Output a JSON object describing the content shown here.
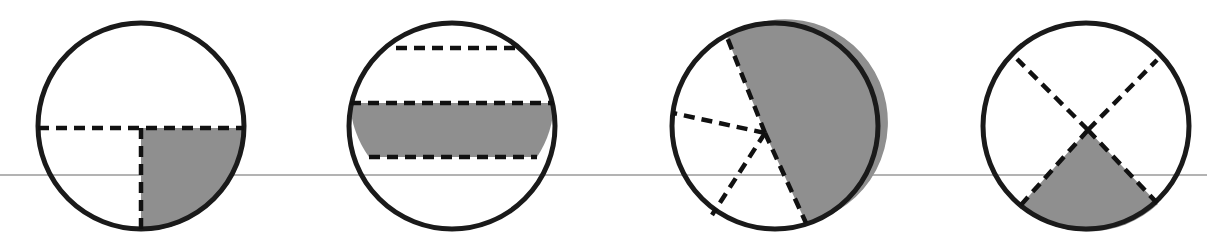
{
  "figure": {
    "width": 1207,
    "height": 251,
    "background_color": "#ffffff",
    "outline_color": "#1a1a1a",
    "outline_width": 5,
    "dash_color": "#111111",
    "dash_width": 4.5,
    "dash_pattern": "11 7",
    "shade_color": "#8f8f8f",
    "baseline_color": "#9a9a9a",
    "baseline_width": 1.6,
    "baseline_y": 175,
    "baseline_x_start": 0,
    "baseline_x_end": 1207
  },
  "circles": [
    {
      "name": "circle-quarter-sector",
      "label": "Circle 1 — quadrant shaded",
      "cx": 141,
      "cy": 126,
      "r": 103,
      "shaded_fraction": 0.25,
      "partition_type": "radius-cross",
      "lines": [
        {
          "name": "horizontal-dashed-chord",
          "x1": 38,
          "y1": 128,
          "x2": 244,
          "y2": 128
        },
        {
          "name": "vertical-dashed-radius",
          "x1": 141,
          "y1": 128,
          "x2": 141,
          "y2": 231
        }
      ],
      "shaded_path": "M 141 128 L 244 128 A 103 103 0 0 1 141 231 Z"
    },
    {
      "name": "circle-horizontal-bands",
      "label": "Circle 2 — horizontal band shaded",
      "cx": 452,
      "cy": 126,
      "r": 103,
      "shaded_fraction": 0.32,
      "partition_type": "parallel-chords",
      "lines": [
        {
          "name": "chord-upper-dashed",
          "x1": 396,
          "y1": 48,
          "x2": 522,
          "y2": 48
        },
        {
          "name": "chord-middle-dashed",
          "x1": 350,
          "y1": 103,
          "x2": 554,
          "y2": 103
        },
        {
          "name": "chord-lower-dashed",
          "x1": 369,
          "y1": 157,
          "x2": 537,
          "y2": 157
        }
      ],
      "shaded_path": "M 350 103 A 103 103 0 0 0 369 157 L 537 157 A 103 103 0 0 0 554 103 Z"
    },
    {
      "name": "circle-off-center-sectors",
      "label": "Circle 3 — large sector shaded",
      "cx": 775,
      "cy": 126,
      "r": 103,
      "shaded_fraction": 0.42,
      "partition_type": "rays-from-interior-point",
      "hub_x": 765,
      "hub_y": 133,
      "lines": [
        {
          "name": "ray-upper-left-dashed",
          "x1": 765,
          "y1": 133,
          "x2": 727,
          "y2": 37
        },
        {
          "name": "ray-left-dashed",
          "x1": 765,
          "y1": 133,
          "x2": 673,
          "y2": 113
        },
        {
          "name": "ray-lower-left-dashed",
          "x1": 765,
          "y1": 133,
          "x2": 712,
          "y2": 215
        },
        {
          "name": "ray-lower-right-dashed",
          "x1": 765,
          "y1": 133,
          "x2": 806,
          "y2": 223
        }
      ],
      "shaded_path": "M 765 133 L 727 37 A 103 103 0 1 1 806 223 Z"
    },
    {
      "name": "circle-x-cross-sectors",
      "label": "Circle 4 — bottom sector shaded",
      "cx": 1086,
      "cy": 126,
      "r": 103,
      "shaded_fraction": 0.26,
      "partition_type": "x-cross",
      "hub_x": 1088,
      "hub_y": 130,
      "lines": [
        {
          "name": "diagonal-upper-left-dashed",
          "x1": 1088,
          "y1": 130,
          "x2": 1017,
          "y2": 59
        },
        {
          "name": "diagonal-upper-right-dashed",
          "x1": 1088,
          "y1": 130,
          "x2": 1157,
          "y2": 60
        },
        {
          "name": "diagonal-lower-left-dashed",
          "x1": 1088,
          "y1": 130,
          "x2": 1020,
          "y2": 206
        },
        {
          "name": "diagonal-lower-right-dashed",
          "x1": 1088,
          "y1": 130,
          "x2": 1158,
          "y2": 204
        }
      ],
      "shaded_path": "M 1088 130 L 1020 206 A 103 103 0 0 0 1158 204 Z"
    }
  ]
}
